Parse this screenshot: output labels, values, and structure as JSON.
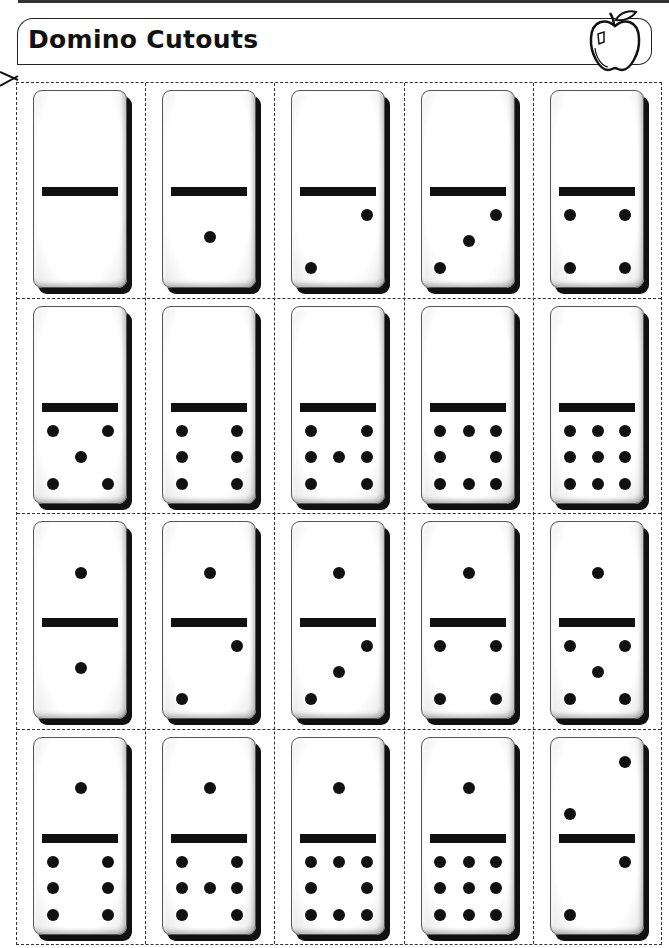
{
  "header": {
    "title": "Domino Cutouts",
    "icon": "apple-icon"
  },
  "cut_line_icon": "scissors-icon",
  "colors": {
    "ink": "#111111",
    "paper": "#ffffff",
    "dashed_border": "#333333"
  },
  "grid": {
    "rows": 4,
    "columns": 5,
    "dominoes": [
      {
        "row": 1,
        "col": 1,
        "top": 0,
        "bottom": 0
      },
      {
        "row": 1,
        "col": 2,
        "top": 0,
        "bottom": 1
      },
      {
        "row": 1,
        "col": 3,
        "top": 0,
        "bottom": 2
      },
      {
        "row": 1,
        "col": 4,
        "top": 0,
        "bottom": 3
      },
      {
        "row": 1,
        "col": 5,
        "top": 0,
        "bottom": 4
      },
      {
        "row": 2,
        "col": 1,
        "top": 0,
        "bottom": 5
      },
      {
        "row": 2,
        "col": 2,
        "top": 0,
        "bottom": 6
      },
      {
        "row": 2,
        "col": 3,
        "top": 0,
        "bottom": 7
      },
      {
        "row": 2,
        "col": 4,
        "top": 0,
        "bottom": 8
      },
      {
        "row": 2,
        "col": 5,
        "top": 0,
        "bottom": 9
      },
      {
        "row": 3,
        "col": 1,
        "top": 1,
        "bottom": 1
      },
      {
        "row": 3,
        "col": 2,
        "top": 1,
        "bottom": 2
      },
      {
        "row": 3,
        "col": 3,
        "top": 1,
        "bottom": 3
      },
      {
        "row": 3,
        "col": 4,
        "top": 1,
        "bottom": 4
      },
      {
        "row": 3,
        "col": 5,
        "top": 1,
        "bottom": 5
      },
      {
        "row": 4,
        "col": 1,
        "top": 1,
        "bottom": 6
      },
      {
        "row": 4,
        "col": 2,
        "top": 1,
        "bottom": 7
      },
      {
        "row": 4,
        "col": 3,
        "top": 1,
        "bottom": 8
      },
      {
        "row": 4,
        "col": 4,
        "top": 1,
        "bottom": 9
      },
      {
        "row": 4,
        "col": 5,
        "top": 2,
        "bottom": 2
      }
    ]
  }
}
